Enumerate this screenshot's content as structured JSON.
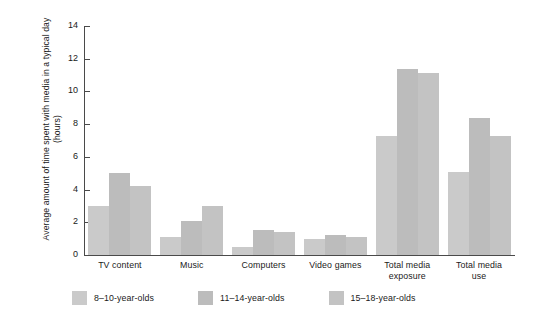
{
  "chart_data": {
    "type": "bar",
    "title": "",
    "subtitle": "",
    "xlabel": "",
    "ylabel": "Average amount of time spent with media in a typical day (hours)",
    "categories": [
      "TV content",
      "Music",
      "Computers",
      "Video games",
      "Total media exposure",
      "Total media use"
    ],
    "category_lines": [
      [
        "TV content"
      ],
      [
        "Music"
      ],
      [
        "Computers"
      ],
      [
        "Video games"
      ],
      [
        "Total media",
        "exposure"
      ],
      [
        "Total media",
        "use"
      ]
    ],
    "series": [
      {
        "name": "8–10-year-olds",
        "color": "#cacaca",
        "values": [
          3.0,
          1.1,
          0.5,
          1.0,
          7.3,
          5.1
        ]
      },
      {
        "name": "11–14-year-olds",
        "color": "#bcbcbc",
        "values": [
          5.0,
          2.1,
          1.5,
          1.2,
          11.4,
          8.4
        ]
      },
      {
        "name": "15–18-year-olds",
        "color": "#c3c3c3",
        "values": [
          4.2,
          3.0,
          1.4,
          1.1,
          11.1,
          7.3
        ]
      }
    ],
    "ylim": [
      0,
      14
    ],
    "yticks": [
      0,
      2,
      4,
      6,
      8,
      10,
      12,
      14
    ],
    "ytick_labels": [
      "0",
      "2",
      "4",
      "6",
      "8",
      "10",
      "12",
      "14"
    ],
    "grid": false,
    "legend_position": "bottom-left"
  },
  "legend": {
    "items": [
      {
        "label": "8–10-year-olds"
      },
      {
        "label": "11–14-year-olds"
      },
      {
        "label": "15–18-year-olds"
      }
    ]
  }
}
